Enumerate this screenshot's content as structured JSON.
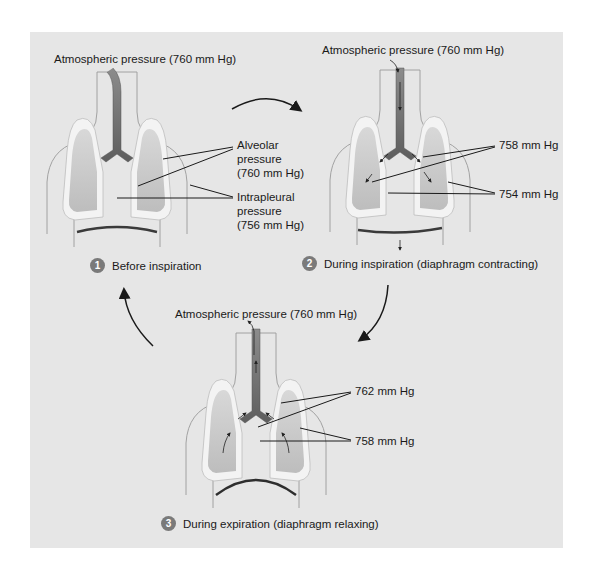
{
  "colors": {
    "panel_bg": "#e6e6e6",
    "body_outline": "#9a9a9a",
    "pleura": "#f2f2f2",
    "lung": "#c9c9c9",
    "airway": "#7f7f7f",
    "step_badge": "#7a7a7a"
  },
  "stages": [
    {
      "number": "1",
      "title": "Before inspiration",
      "atmospheric_label": "Atmospheric pressure (760 mm Hg)",
      "alveolar_label_lines": [
        "Alveolar",
        "pressure",
        "(760 mm Hg)"
      ],
      "intrapleural_label_lines": [
        "Intrapleural",
        "pressure",
        "(756 mm Hg)"
      ]
    },
    {
      "number": "2",
      "title": "During inspiration (diaphragm contracting)",
      "atmospheric_label": "Atmospheric pressure (760 mm Hg)",
      "alveolar_label": "758 mm Hg",
      "intrapleural_label": "754 mm Hg"
    },
    {
      "number": "3",
      "title": "During expiration (diaphragm relaxing)",
      "atmospheric_label": "Atmospheric pressure (760 mm Hg)",
      "alveolar_label": "762 mm Hg",
      "intrapleural_label": "758 mm Hg"
    }
  ]
}
